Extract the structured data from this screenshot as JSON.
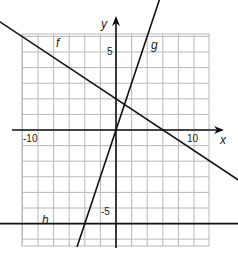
{
  "chart_data": {
    "type": "line",
    "title": "",
    "xlabel": "x",
    "ylabel": "y",
    "xlim": [
      -10.5,
      12
    ],
    "ylim": [
      -7.5,
      7
    ],
    "grid": true,
    "tick_labels": {
      "x": [
        {
          "value": -10,
          "label": "-10"
        },
        {
          "value": 10,
          "label": "10"
        }
      ],
      "y": [
        {
          "value": 5,
          "label": "5"
        },
        {
          "value": -5,
          "label": "-5"
        }
      ]
    },
    "series": [
      {
        "name": "f",
        "equation": "y = -2/3 x + 2",
        "points": [
          [
            -9.5,
            8.3
          ],
          [
            12.5,
            -6.3
          ]
        ]
      },
      {
        "name": "g",
        "equation": "y = 3x",
        "points": [
          [
            -2.5,
            -7.5
          ],
          [
            3.3,
            9.9
          ]
        ]
      },
      {
        "name": "h",
        "equation": "y = -6",
        "points": [
          [
            -11.5,
            -6
          ],
          [
            12,
            -6
          ]
        ]
      }
    ],
    "legend": "inline labels f, g, h"
  },
  "labels": {
    "x_axis": "x",
    "y_axis": "y",
    "f": "f",
    "g": "g",
    "h": "h",
    "tick_x_neg10": "-10",
    "tick_x_10": "10",
    "tick_y_5": "5",
    "tick_y_neg5": "-5"
  },
  "colors": {
    "grid": "#b8b8b8",
    "axis": "#111111",
    "line": "#111111"
  }
}
